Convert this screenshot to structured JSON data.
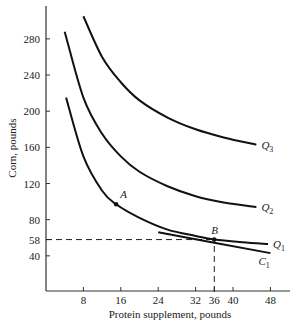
{
  "chart_data": {
    "type": "line",
    "title": "",
    "xlabel": "Protein supplement, pounds",
    "ylabel": "Corn, pounds",
    "xlim": [
      0,
      52
    ],
    "ylim": [
      0,
      300
    ],
    "grid": false,
    "x_ticks": [
      8,
      16,
      24,
      32,
      36,
      40,
      48
    ],
    "y_ticks": [
      40,
      58,
      80,
      120,
      160,
      200,
      240,
      280
    ],
    "series": [
      {
        "name": "Q1",
        "label": "Q",
        "sub": "1",
        "type": "isoquant",
        "x": [
          4.3,
          8,
          12,
          15,
          20,
          26,
          32,
          36,
          42,
          47.5
        ],
        "y": [
          215,
          150,
          112,
          97,
          82,
          69,
          62,
          58,
          55,
          53
        ]
      },
      {
        "name": "Q2",
        "label": "Q",
        "sub": "2",
        "type": "isoquant",
        "x": [
          4,
          8,
          12,
          16,
          20,
          26,
          32,
          38,
          45
        ],
        "y": [
          288,
          215,
          175,
          150,
          133,
          117,
          106,
          99,
          94
        ]
      },
      {
        "name": "Q3",
        "label": "Q",
        "sub": "3",
        "type": "isoquant",
        "x": [
          8,
          12,
          16,
          20,
          26,
          32,
          38,
          45
        ],
        "y": [
          305,
          260,
          232,
          212,
          193,
          180,
          171,
          163
        ]
      },
      {
        "name": "C1",
        "label": "C",
        "sub": "1",
        "type": "isocost",
        "x": [
          24,
          48
        ],
        "y": [
          66,
          43
        ]
      }
    ],
    "points": [
      {
        "name": "A",
        "x": 15,
        "y": 97
      },
      {
        "name": "B",
        "x": 36,
        "y": 58
      }
    ],
    "reference_lines": [
      {
        "type": "horizontal",
        "y": 58,
        "from_x": 0,
        "to_x": 36,
        "style": "dashed"
      },
      {
        "type": "vertical",
        "x": 36,
        "from_y": 0,
        "to_y": 58,
        "style": "dashed"
      }
    ]
  }
}
